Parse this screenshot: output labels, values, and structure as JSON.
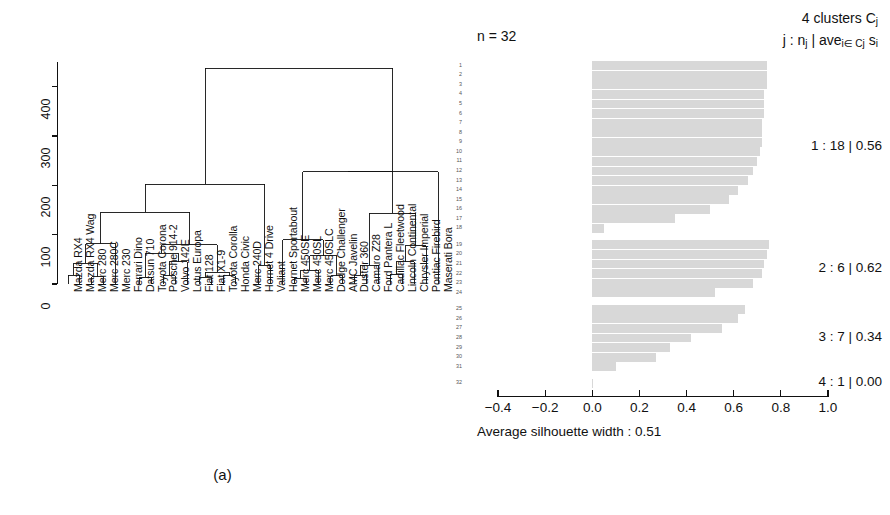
{
  "figure": {
    "caption_a": "(a)",
    "caption_b": "(b)"
  },
  "chart_data": [
    {
      "type": "dendrogram",
      "panel": "a",
      "title": "",
      "xlabel": "",
      "ylabel": "",
      "ylim": [
        0,
        450
      ],
      "y_ticks": [
        0,
        100,
        200,
        300,
        400
      ],
      "y_tick_labels": [
        "0",
        "100",
        "200",
        "300",
        "400"
      ],
      "grid": false,
      "leaf_labels": [
        "Mazda RX4",
        "Mazda RX4 Wag",
        "Merc 280",
        "Merc 280C",
        "Merc 230",
        "Ferrari Dino",
        "Datsun 710",
        "Toyota Corona",
        "Porsche 914-2",
        "Volvo 142E",
        "Lotus Europa",
        "Fiat 128",
        "Fiat X1-9",
        "Toyota Corolla",
        "Honda Civic",
        "Merc 240D",
        "Hornet 4 Drive",
        "Valiant",
        "Hornet Sportabout",
        "Merc 450SE",
        "Merc 450SL",
        "Merc 450SLC",
        "Dodge Challenger",
        "AMC Javelin",
        "Duster 360",
        "Camaro Z28",
        "Ford Pantera L",
        "Cadillac Fleetwood",
        "Lincoln Continental",
        "Chrysler Imperial",
        "Pontiac Firebird",
        "Maserati Bora"
      ],
      "merges": [
        {
          "left": "leaf:0",
          "right": "leaf:1",
          "height": 18
        },
        {
          "left": "leaf:2",
          "right": "leaf:3",
          "height": 15
        },
        {
          "left": "node:0",
          "right": "node:1",
          "height": 42
        },
        {
          "left": "node:2",
          "right": "leaf:4",
          "height": 82
        },
        {
          "left": "leaf:6",
          "right": "leaf:7",
          "height": 14
        },
        {
          "left": "leaf:8",
          "right": "leaf:9",
          "height": 17
        },
        {
          "left": "node:5",
          "right": "leaf:10",
          "height": 45
        },
        {
          "left": "node:4",
          "right": "node:6",
          "height": 62
        },
        {
          "left": "leaf:11",
          "right": "leaf:12",
          "height": 14
        },
        {
          "left": "leaf:13",
          "right": "leaf:14",
          "height": 17
        },
        {
          "left": "node:8",
          "right": "node:9",
          "height": 24
        },
        {
          "left": "node:7",
          "right": "node:10",
          "height": 80
        },
        {
          "left": "node:3",
          "right": "node:11",
          "height": 145
        },
        {
          "left": "leaf:16",
          "right": "leaf:17",
          "height": 38
        },
        {
          "left": "node:12",
          "right": "node:13",
          "height": 202
        },
        {
          "left": "leaf:19",
          "right": "leaf:20",
          "height": 12
        },
        {
          "left": "node:15",
          "right": "leaf:21",
          "height": 28
        },
        {
          "left": "leaf:22",
          "right": "leaf:23",
          "height": 17
        },
        {
          "left": "node:16",
          "right": "node:17",
          "height": 57
        },
        {
          "left": "leaf:18",
          "right": "node:18",
          "height": 90
        },
        {
          "left": "leaf:24",
          "right": "leaf:25",
          "height": 18
        },
        {
          "left": "node:20",
          "right": "leaf:26",
          "height": 38
        },
        {
          "left": "leaf:27",
          "right": "leaf:28",
          "height": 20
        },
        {
          "left": "node:22",
          "right": "leaf:29",
          "height": 45
        },
        {
          "left": "node:23",
          "right": "leaf:30",
          "height": 78
        },
        {
          "left": "node:21",
          "right": "node:24",
          "height": 143
        },
        {
          "left": "node:19",
          "right": "node:25",
          "height": 228
        },
        {
          "left": "node:26",
          "right": "leaf:31",
          "height": 228
        },
        {
          "left": "node:14",
          "right": "node:27",
          "height": 437
        }
      ]
    },
    {
      "type": "silhouette",
      "panel": "b",
      "n_label": "n = 32",
      "header_line1_prefix": "4 clusters C",
      "header_line1_sub": "j",
      "header_line2": "j : nj | avei∈ Cj si",
      "xlabel": "Average silhouette width : 0.51",
      "average_silhouette_width": 0.51,
      "xlim": [
        -0.4,
        1.0
      ],
      "x_ticks": [
        -0.4,
        -0.2,
        0.0,
        0.2,
        0.4,
        0.6,
        0.8,
        1.0
      ],
      "x_tick_labels": [
        "−0.4",
        "−0.2",
        "0.0",
        "0.2",
        "0.4",
        "0.6",
        "0.8",
        "1.0"
      ],
      "grid": false,
      "bar_color": "#d8d8d8",
      "clusters": [
        {
          "id": 1,
          "label": "1 : 18 | 0.56",
          "size": 18,
          "avg": 0.56,
          "values": [
            0.74,
            0.74,
            0.74,
            0.73,
            0.73,
            0.73,
            0.72,
            0.72,
            0.72,
            0.71,
            0.7,
            0.68,
            0.66,
            0.62,
            0.58,
            0.5,
            0.35,
            0.05
          ]
        },
        {
          "id": 2,
          "label": "2 : 6 | 0.62",
          "size": 6,
          "avg": 0.62,
          "values": [
            0.75,
            0.74,
            0.73,
            0.72,
            0.68,
            0.52
          ]
        },
        {
          "id": 3,
          "label": "3 : 7 | 0.34",
          "size": 7,
          "avg": 0.34,
          "values": [
            0.65,
            0.62,
            0.55,
            0.42,
            0.33,
            0.27,
            0.1
          ]
        },
        {
          "id": 4,
          "label": "4 : 1 | 0.00",
          "size": 1,
          "avg": 0.0,
          "values": [
            0.0
          ]
        }
      ],
      "observation_numbers": [
        1,
        2,
        3,
        4,
        5,
        6,
        7,
        8,
        9,
        10,
        11,
        12,
        13,
        14,
        15,
        16,
        17,
        18,
        19,
        20,
        21,
        22,
        23,
        24,
        25,
        26,
        27,
        28,
        29,
        30,
        31,
        32
      ]
    }
  ]
}
